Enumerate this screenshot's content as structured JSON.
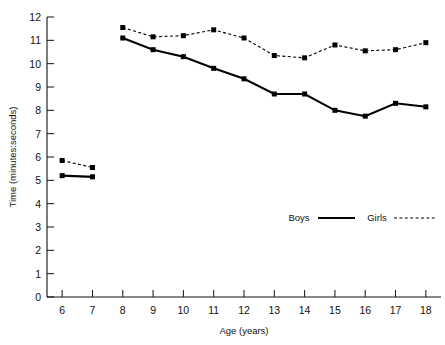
{
  "chart_data": {
    "type": "line",
    "title": "",
    "xlabel": "Age (years)",
    "ylabel": "Time (minutes:seconds)",
    "x": [
      6,
      7,
      8,
      9,
      10,
      11,
      12,
      13,
      14,
      15,
      16,
      17,
      18
    ],
    "xlim": [
      5.5,
      18.5
    ],
    "ylim": [
      0,
      12
    ],
    "xticks": [
      6,
      7,
      8,
      9,
      10,
      11,
      12,
      13,
      14,
      15,
      16,
      17,
      18
    ],
    "yticks": [
      0,
      1,
      2,
      3,
      4,
      5,
      6,
      7,
      8,
      9,
      10,
      11,
      12
    ],
    "grid": false,
    "legend_position": "inside-lower-right",
    "series": [
      {
        "name": "Boys",
        "style": "solid",
        "marker": "square",
        "color": "#000000",
        "x": [
          6,
          7,
          8,
          9,
          10,
          11,
          12,
          13,
          14,
          15,
          16,
          17,
          18
        ],
        "values": [
          5.2,
          5.15,
          11.1,
          10.6,
          10.3,
          9.8,
          9.35,
          8.7,
          8.7,
          8.0,
          7.75,
          8.3,
          8.15
        ]
      },
      {
        "name": "Girls",
        "style": "dotted",
        "marker": "square",
        "color": "#000000",
        "x": [
          6,
          7,
          8,
          9,
          10,
          11,
          12,
          13,
          14,
          15,
          16,
          17,
          18
        ],
        "values": [
          5.85,
          5.55,
          11.55,
          11.15,
          11.2,
          11.45,
          11.1,
          10.35,
          10.25,
          10.8,
          10.55,
          10.6,
          10.9
        ]
      }
    ],
    "segment_breaks": [
      {
        "series": "Boys",
        "after_x": 7
      },
      {
        "series": "Girls",
        "after_x": 7
      }
    ],
    "annotations": []
  },
  "legend": {
    "boys_label": "Boys",
    "girls_label": "Girls"
  },
  "axes": {
    "x_title": "Age (years)",
    "y_title": "Time (minutes:seconds)"
  }
}
